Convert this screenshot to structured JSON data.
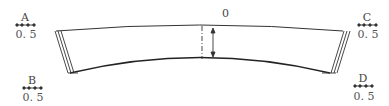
{
  "diagram": {
    "center_label": "0",
    "corners": [
      {
        "id": "A",
        "label": "A",
        "value": "0. 5"
      },
      {
        "id": "B",
        "label": "B",
        "value": "0. 5"
      },
      {
        "id": "C",
        "label": "C",
        "value": "0. 5"
      },
      {
        "id": "D",
        "label": "D",
        "value": "0. 5"
      }
    ],
    "colors": {
      "line": "#333333",
      "background": "#ffffff"
    }
  }
}
